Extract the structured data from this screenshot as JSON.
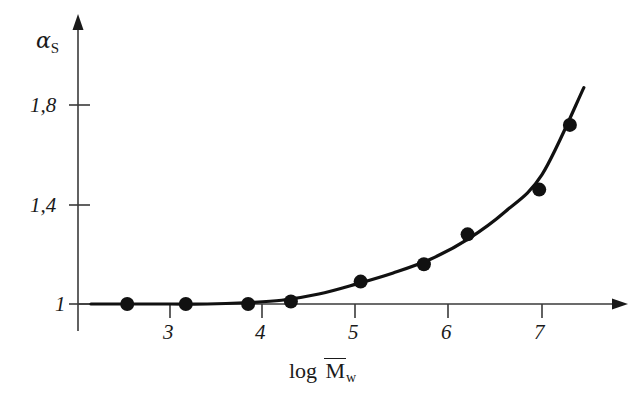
{
  "figure": {
    "name": "expansion-factor-vs-log-molecular-weight"
  },
  "axes": {
    "y_label_symbol": "α",
    "y_label_subscript": "S",
    "x_label_prefix": "log",
    "x_label_symbol": "M",
    "x_label_subscript": "w",
    "y_ticks": [
      {
        "value": 1.8,
        "label": "1,8"
      },
      {
        "value": 1.4,
        "label": "1,4"
      },
      {
        "value": 1.0,
        "label": "1"
      }
    ],
    "x_ticks": [
      {
        "value": 3,
        "label": "3"
      },
      {
        "value": 4,
        "label": "4"
      },
      {
        "value": 5,
        "label": "5"
      },
      {
        "value": 6,
        "label": "6"
      },
      {
        "value": 7,
        "label": "7"
      }
    ]
  },
  "style": {
    "line_color": "#111111",
    "marker_color": "#111111",
    "axis_color": "#3a3a3a",
    "background": "#ffffff"
  },
  "chart_data": {
    "type": "scatter",
    "title": "",
    "xlabel": "log M̄w",
    "ylabel": "αS",
    "xlim": [
      2.1,
      7.8
    ],
    "ylim": [
      0.93,
      1.95
    ],
    "grid": false,
    "legend": "none",
    "x_tick_labels": [
      "3",
      "4",
      "5",
      "6",
      "7"
    ],
    "y_tick_labels": [
      "1",
      "1,4",
      "1,8"
    ],
    "series": [
      {
        "name": "measured points",
        "marker": "filled-circle",
        "x": [
          2.54,
          3.17,
          3.84,
          4.3,
          5.05,
          5.73,
          6.2,
          6.97,
          7.3
        ],
        "y": [
          1.0,
          1.0,
          1.0,
          1.01,
          1.09,
          1.16,
          1.28,
          1.46,
          1.72
        ]
      },
      {
        "name": "fitted curve",
        "marker": "none",
        "x": [
          2.15,
          2.6,
          3.0,
          3.4,
          3.8,
          4.2,
          4.6,
          5.0,
          5.4,
          5.8,
          6.2,
          6.6,
          7.0,
          7.45
        ],
        "y": [
          1.0,
          1.0,
          1.0,
          1.0,
          1.005,
          1.015,
          1.04,
          1.08,
          1.125,
          1.18,
          1.26,
          1.37,
          1.52,
          1.87
        ]
      }
    ]
  }
}
